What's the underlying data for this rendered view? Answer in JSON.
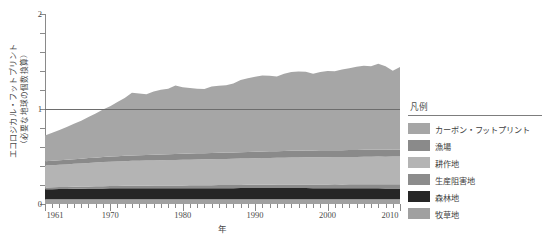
{
  "chart_data": {
    "type": "area",
    "stacked": true,
    "title": "",
    "xlabel": "年",
    "ylabel": "エコロジカル・フットプリント（必要な地球の個数換算）",
    "ylabel_line1": "エコロジカル・フットプリント",
    "ylabel_line2": "（必要な地球の個数換算）",
    "xlim": [
      1961,
      2010
    ],
    "ylim": [
      0,
      2
    ],
    "yticks": [
      0,
      1,
      2
    ],
    "ytick_labels": [
      "0",
      "1",
      "2"
    ],
    "xticks": [
      1961,
      1970,
      1980,
      1990,
      2000,
      2010
    ],
    "xtick_labels": [
      "1961",
      "1970",
      "1980",
      "1990",
      "2000",
      "2010"
    ],
    "grid": false,
    "legend_position": "right",
    "reference_line": {
      "value": 1,
      "color": "#6d6d6d",
      "label": ""
    },
    "x": [
      1961,
      1962,
      1963,
      1964,
      1965,
      1966,
      1967,
      1968,
      1969,
      1970,
      1971,
      1972,
      1973,
      1974,
      1975,
      1976,
      1977,
      1978,
      1979,
      1980,
      1981,
      1982,
      1983,
      1984,
      1985,
      1986,
      1987,
      1988,
      1989,
      1990,
      1991,
      1992,
      1993,
      1994,
      1995,
      1996,
      1997,
      1998,
      1999,
      2000,
      2001,
      2002,
      2003,
      2004,
      2005,
      2006,
      2007,
      2008,
      2009,
      2010
    ],
    "series": [
      {
        "name": "牧草地",
        "color": "#a0a0a0",
        "values": [
          0.05,
          0.05,
          0.05,
          0.05,
          0.05,
          0.05,
          0.05,
          0.05,
          0.05,
          0.05,
          0.05,
          0.05,
          0.05,
          0.05,
          0.05,
          0.05,
          0.05,
          0.05,
          0.05,
          0.05,
          0.05,
          0.05,
          0.05,
          0.05,
          0.05,
          0.05,
          0.05,
          0.05,
          0.05,
          0.05,
          0.05,
          0.05,
          0.05,
          0.05,
          0.05,
          0.05,
          0.05,
          0.05,
          0.05,
          0.05,
          0.05,
          0.05,
          0.05,
          0.05,
          0.05,
          0.05,
          0.05,
          0.05,
          0.05,
          0.05
        ]
      },
      {
        "name": "森林地",
        "color": "#262626",
        "values": [
          0.105,
          0.106,
          0.107,
          0.108,
          0.11,
          0.111,
          0.112,
          0.113,
          0.114,
          0.115,
          0.115,
          0.116,
          0.116,
          0.116,
          0.116,
          0.117,
          0.117,
          0.117,
          0.117,
          0.117,
          0.117,
          0.117,
          0.117,
          0.117,
          0.117,
          0.117,
          0.117,
          0.118,
          0.118,
          0.118,
          0.118,
          0.118,
          0.118,
          0.118,
          0.118,
          0.118,
          0.118,
          0.117,
          0.117,
          0.117,
          0.117,
          0.116,
          0.116,
          0.116,
          0.116,
          0.115,
          0.115,
          0.114,
          0.113,
          0.113
        ]
      },
      {
        "name": "生産阻害地",
        "color": "#8c8c8c",
        "values": [
          0.02,
          0.02,
          0.021,
          0.021,
          0.022,
          0.022,
          0.023,
          0.023,
          0.024,
          0.024,
          0.025,
          0.025,
          0.026,
          0.026,
          0.027,
          0.027,
          0.028,
          0.028,
          0.029,
          0.029,
          0.03,
          0.03,
          0.031,
          0.031,
          0.032,
          0.032,
          0.033,
          0.033,
          0.034,
          0.034,
          0.035,
          0.035,
          0.036,
          0.036,
          0.037,
          0.037,
          0.038,
          0.038,
          0.039,
          0.039,
          0.04,
          0.04,
          0.041,
          0.041,
          0.042,
          0.042,
          0.043,
          0.043,
          0.044,
          0.044
        ]
      },
      {
        "name": "耕作地",
        "color": "#b4b4b4",
        "values": [
          0.23,
          0.232,
          0.235,
          0.238,
          0.241,
          0.244,
          0.247,
          0.25,
          0.253,
          0.256,
          0.258,
          0.26,
          0.262,
          0.263,
          0.264,
          0.265,
          0.266,
          0.267,
          0.268,
          0.269,
          0.27,
          0.271,
          0.272,
          0.273,
          0.274,
          0.275,
          0.276,
          0.277,
          0.278,
          0.279,
          0.28,
          0.281,
          0.282,
          0.283,
          0.284,
          0.285,
          0.286,
          0.286,
          0.287,
          0.287,
          0.288,
          0.288,
          0.289,
          0.289,
          0.29,
          0.29,
          0.291,
          0.291,
          0.292,
          0.292
        ]
      },
      {
        "name": "漁場",
        "color": "#8a8a8a",
        "values": [
          0.045,
          0.046,
          0.047,
          0.048,
          0.049,
          0.05,
          0.051,
          0.052,
          0.053,
          0.054,
          0.055,
          0.056,
          0.057,
          0.058,
          0.059,
          0.06,
          0.061,
          0.062,
          0.063,
          0.064,
          0.064,
          0.065,
          0.065,
          0.066,
          0.066,
          0.067,
          0.067,
          0.068,
          0.068,
          0.069,
          0.069,
          0.07,
          0.07,
          0.07,
          0.071,
          0.071,
          0.071,
          0.071,
          0.072,
          0.072,
          0.072,
          0.072,
          0.072,
          0.073,
          0.073,
          0.073,
          0.073,
          0.073,
          0.074,
          0.074
        ]
      },
      {
        "name": "カーボン・フットプリント",
        "color": "#a6a6a6",
        "values": [
          0.27,
          0.296,
          0.32,
          0.345,
          0.372,
          0.4,
          0.432,
          0.465,
          0.5,
          0.53,
          0.57,
          0.61,
          0.66,
          0.65,
          0.64,
          0.665,
          0.68,
          0.69,
          0.72,
          0.7,
          0.69,
          0.68,
          0.675,
          0.7,
          0.705,
          0.71,
          0.725,
          0.76,
          0.775,
          0.79,
          0.8,
          0.795,
          0.785,
          0.815,
          0.83,
          0.835,
          0.83,
          0.81,
          0.825,
          0.835,
          0.83,
          0.85,
          0.86,
          0.875,
          0.885,
          0.88,
          0.905,
          0.88,
          0.83,
          0.87
        ]
      }
    ],
    "totals_note": "合計＝積み上げ値"
  },
  "legend": {
    "title": "凡例",
    "items": [
      {
        "label": "カーボン・フットプリント",
        "color": "#a6a6a6"
      },
      {
        "label": "漁場",
        "color": "#8a8a8a"
      },
      {
        "label": "耕作地",
        "color": "#b4b4b4"
      },
      {
        "label": "生産阻害地",
        "color": "#8c8c8c"
      },
      {
        "label": "森林地",
        "color": "#262626"
      },
      {
        "label": "牧草地",
        "color": "#a0a0a0"
      }
    ]
  },
  "caption": ""
}
